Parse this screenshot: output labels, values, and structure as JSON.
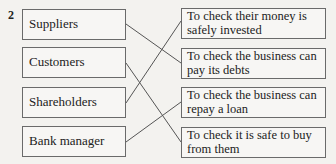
{
  "question_number": "2",
  "left_items": [
    {
      "label": "Suppliers"
    },
    {
      "label": "Customers"
    },
    {
      "label": "Shareholders"
    },
    {
      "label": "Bank manager"
    }
  ],
  "right_items": [
    {
      "label": "To check their money is safely invested"
    },
    {
      "label": "To check the business can pay its debts"
    },
    {
      "label": "To check the business can repay a loan"
    },
    {
      "label": "To check it is safe to buy from them"
    }
  ],
  "matches": [
    {
      "left": "Suppliers",
      "right": "To check the business can pay its debts"
    },
    {
      "left": "Customers",
      "right": "To check it is safe to buy from them"
    },
    {
      "left": "Shareholders",
      "right": "To check their money is safely invested"
    },
    {
      "left": "Bank manager",
      "right": "To check the business can repay a loan"
    }
  ]
}
